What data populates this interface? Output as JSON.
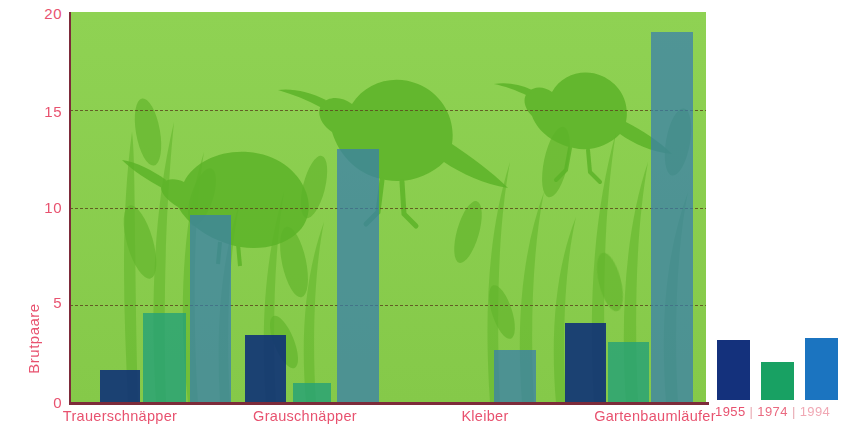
{
  "chart_data": {
    "type": "bar",
    "title": "",
    "subtitle": "",
    "xlabel": "",
    "ylabel": "Brutpaare",
    "ylim": [
      0,
      20
    ],
    "yticks": [
      "0",
      "5",
      "10",
      "15",
      "20"
    ],
    "grid": true,
    "legend_position": "bottom-right",
    "categories": [
      "Trauerschnäpper",
      "Grauschnäpper",
      "Kleiber",
      "Gartenbaumläufer"
    ],
    "series": [
      {
        "name": "1955",
        "color": "#14317c",
        "values": [
          1.7,
          3.5,
          0,
          4.1
        ]
      },
      {
        "name": "1974",
        "color": "#18a163",
        "values": [
          4.6,
          1.0,
          0,
          3.1
        ]
      },
      {
        "name": "1994",
        "color": "#1b74c0",
        "values": [
          9.6,
          13.0,
          2.7,
          19.0
        ]
      }
    ],
    "annotations": [
      "background illustration: green field with bird silhouettes and reed grasses"
    ]
  },
  "axis": {
    "y_title": "Brutpaare",
    "y_ticks": [
      "20",
      "15",
      "10",
      "5",
      "0"
    ]
  },
  "legend": {
    "entries": [
      "1955",
      "1974",
      "1994"
    ],
    "separator": "|",
    "text": "1955 | 1974 | 1994"
  },
  "colors": {
    "plot_background": "#8ace4e",
    "axis": "#7d2b3a",
    "label": "#e8526f",
    "series_1955": "#14317c",
    "series_1974": "#18a163",
    "series_1994": "#1b74c0"
  }
}
